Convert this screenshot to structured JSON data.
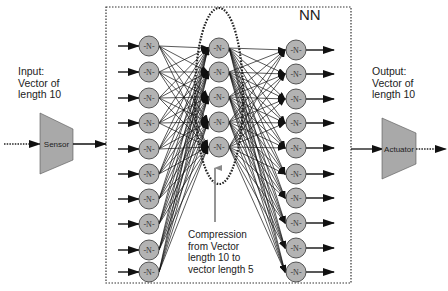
{
  "diagram": {
    "title": "NN",
    "input_label": "Input:\nVector of\nlength 10",
    "output_label": "Output:\nVector of\nlength 10",
    "sensor_label": "Sensor",
    "actuator_label": "Actuator",
    "compression_label": "Compression\nfrom Vector\nlength 10 to\nvector length 5",
    "neuron_label": "-N-",
    "colors": {
      "block_fill": "#a9a9a9",
      "neuron_fill": "#b3b3b3",
      "stroke": "#222222",
      "background": "#ffffff",
      "pointer_arrow": "#8a8a8a"
    },
    "layers": [
      {
        "name": "input-layer",
        "count": 10,
        "x": 149,
        "ys": [
          46,
          72,
          98,
          123,
          149,
          174,
          199,
          224,
          250,
          272
        ]
      },
      {
        "name": "hidden-layer",
        "count": 5,
        "x": 219,
        "ys": [
          48,
          72,
          97,
          122,
          147
        ]
      },
      {
        "name": "output-layer",
        "count": 10,
        "x": 296,
        "ys": [
          50,
          74,
          99,
          123,
          148,
          174,
          198,
          223,
          248,
          272
        ]
      }
    ],
    "nn_box": {
      "x": 106,
      "y": 7,
      "w": 245,
      "h": 276
    },
    "ellipse": {
      "cx": 219,
      "cy": 96,
      "rx": 24,
      "ry": 88
    }
  }
}
